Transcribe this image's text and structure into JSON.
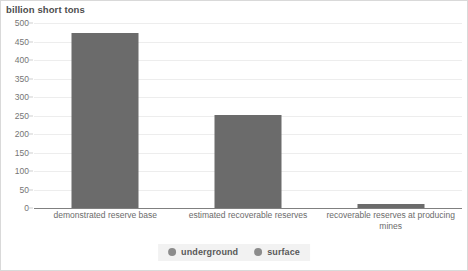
{
  "chart_data": {
    "type": "bar",
    "title": "billion short tons",
    "xlabel": "",
    "ylabel": "billion short tons",
    "categories": [
      "demonstrated reserve base",
      "estimated recoverable reserves",
      "recoverable reserves at producing mines"
    ],
    "values": [
      472,
      252,
      12
    ],
    "series": [
      {
        "name": "underground",
        "values": [
          472,
          252,
          12
        ]
      }
    ],
    "ylim": [
      0,
      500
    ],
    "yticks": [
      0,
      50,
      100,
      150,
      200,
      250,
      300,
      350,
      400,
      450,
      500
    ],
    "ytick_labels": [
      "0",
      "50",
      "100",
      "150",
      "200",
      "250",
      "300",
      "350",
      "400",
      "450",
      "500"
    ],
    "grid": true,
    "legend_position": "bottom",
    "legend": [
      {
        "label": "underground",
        "color": "#8c8c8c",
        "marker": "circle-icon"
      },
      {
        "label": "surface",
        "color": "#8c8c8c",
        "marker": "circle-icon"
      }
    ],
    "bar_color": "#6b6b6b",
    "annotations": []
  },
  "category_labels": {
    "0": {
      "line1": "demonstrated reserve base",
      "line2": ""
    },
    "1": {
      "line1": "estimated recoverable reserves",
      "line2": ""
    },
    "2": {
      "line1": "recoverable reserves at producing",
      "line2": "mines"
    }
  }
}
